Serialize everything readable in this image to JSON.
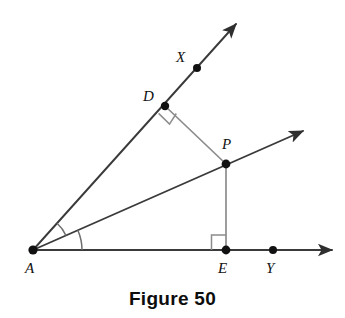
{
  "figure": {
    "caption": "Figure 50",
    "background_color": "#ffffff",
    "ray_color": "#3a3a3a",
    "segment_color": "#8c8c8c",
    "arc_color": "#6e6e6e",
    "point_color": "#111111",
    "label_color": "#111111",
    "width": 345,
    "height": 318
  },
  "points": [
    {
      "id": "A",
      "label": "A",
      "x": 33,
      "y": 250,
      "label_x": 25,
      "label_y": 261,
      "dot": true,
      "dot_r": 4.6
    },
    {
      "id": "D",
      "label": "D",
      "x": 165,
      "y": 106,
      "label_x": 143,
      "label_y": 89,
      "dot": true,
      "dot_r": 4.2
    },
    {
      "id": "X",
      "label": "X",
      "x": 197,
      "y": 68,
      "label_x": 176,
      "label_y": 50,
      "dot": true,
      "dot_r": 4.0
    },
    {
      "id": "P",
      "label": "P",
      "x": 226,
      "y": 164,
      "label_x": 222,
      "label_y": 137,
      "dot": true,
      "dot_r": 4.4
    },
    {
      "id": "E",
      "label": "E",
      "x": 226,
      "y": 250,
      "label_x": 218,
      "label_y": 261,
      "dot": true,
      "dot_r": 4.4
    },
    {
      "id": "Y",
      "label": "Y",
      "x": 273,
      "y": 250,
      "label_x": 266,
      "label_y": 261,
      "dot": true,
      "dot_r": 4.0
    }
  ],
  "rays": [
    {
      "id": "AX",
      "from": "A",
      "label": "ray-AX",
      "x1": 33,
      "y1": 250,
      "x2": 236,
      "y2": 24
    },
    {
      "id": "AP",
      "from": "A",
      "label": "ray-AP",
      "x1": 33,
      "y1": 250,
      "x2": 303,
      "y2": 131
    },
    {
      "id": "AY",
      "from": "A",
      "label": "ray-AY",
      "x1": 33,
      "y1": 250,
      "x2": 332,
      "y2": 250
    }
  ],
  "segments": [
    {
      "id": "DP",
      "label": "segment-DP",
      "x1": 165,
      "y1": 106,
      "x2": 226,
      "y2": 164
    },
    {
      "id": "PE",
      "label": "segment-PE",
      "x1": 226,
      "y1": 164,
      "x2": 226,
      "y2": 250
    }
  ],
  "right_angles": [
    {
      "id": "at-D",
      "label": "right-angle-marker-D",
      "path": "M 158.6 113.4 L 169.5 124.1 L 176.3 113.5"
    },
    {
      "id": "at-E",
      "label": "right-angle-marker-E",
      "path": "M 211.5 250 L 211.5 235 L 226 235"
    }
  ],
  "angle_arcs": [
    {
      "id": "XAP",
      "label": "angle-arc-XAP",
      "radius": 36,
      "start_deg": -48.1,
      "end_deg": -23.8
    },
    {
      "id": "PAY",
      "label": "angle-arc-PAY",
      "radius": 49,
      "start_deg": -23.8,
      "end_deg": 0
    }
  ]
}
